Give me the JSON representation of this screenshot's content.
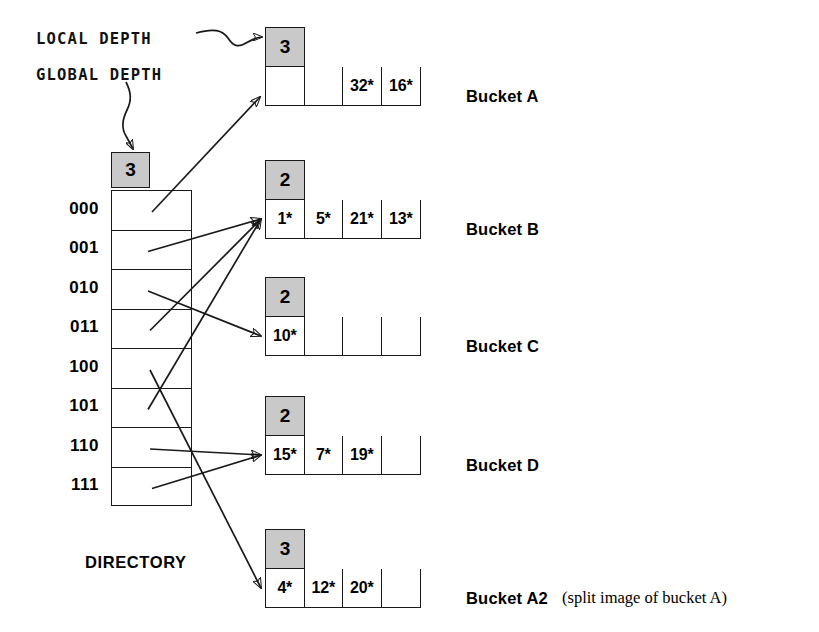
{
  "annotations": {
    "local_depth_label": "LOCAL DEPTH",
    "global_depth_label": "GLOBAL DEPTH"
  },
  "directory": {
    "caption": "DIRECTORY",
    "global_depth": "3",
    "entries": [
      {
        "index": "000",
        "points_to": "Bucket A"
      },
      {
        "index": "001",
        "points_to": "Bucket B"
      },
      {
        "index": "010",
        "points_to": "Bucket C"
      },
      {
        "index": "011",
        "points_to": "Bucket B"
      },
      {
        "index": "100",
        "points_to": "Bucket A2"
      },
      {
        "index": "101",
        "points_to": "Bucket B"
      },
      {
        "index": "110",
        "points_to": "Bucket D"
      },
      {
        "index": "111",
        "points_to": "Bucket D"
      }
    ]
  },
  "buckets": [
    {
      "name": "Bucket A",
      "local_depth": "3",
      "cells": [
        "",
        "",
        "32*",
        "16*"
      ],
      "note": ""
    },
    {
      "name": "Bucket B",
      "local_depth": "2",
      "cells": [
        "1*",
        "5*",
        "21*",
        "13*"
      ],
      "note": ""
    },
    {
      "name": "Bucket C",
      "local_depth": "2",
      "cells": [
        "10*",
        "",
        "",
        ""
      ],
      "note": ""
    },
    {
      "name": "Bucket D",
      "local_depth": "2",
      "cells": [
        "15*",
        "7*",
        "19*",
        ""
      ],
      "note": ""
    },
    {
      "name": "Bucket A2",
      "local_depth": "3",
      "cells": [
        "4*",
        "12*",
        "20*",
        ""
      ],
      "note": "(split image of bucket A)"
    }
  ],
  "colors": {
    "depth_box_fill": "#c9c9c9",
    "line": "#1a1a1a",
    "background": "#ffffff"
  }
}
